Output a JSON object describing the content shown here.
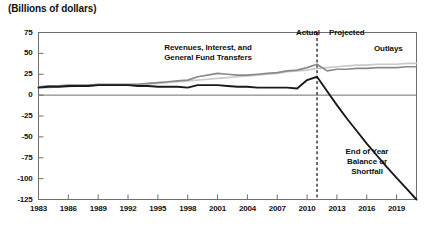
{
  "header": {
    "unit_title": "(Billions of dollars)"
  },
  "annotations": {
    "actual_label": "Actual",
    "projected_label": "Projected",
    "outlays_label": "Outlays",
    "revenues_label_line1": "Revenues, Interest, and",
    "revenues_label_line2": "General Fund Transfers",
    "balance_label_line1": "End of Year",
    "balance_label_line2": "Balance or",
    "balance_label_line3": "Shortfall"
  },
  "colors": {
    "outlays": "#c9c9c9",
    "revenues": "#8a8a8a",
    "balance": "#1a1a1a",
    "axis": "#6f6f6f",
    "divider": "#111111",
    "text": "#111111"
  },
  "chart_data": {
    "type": "line",
    "title": "(Billions of dollars)",
    "xlabel": "",
    "ylabel": "Billions of dollars",
    "xlim": [
      1983,
      2021
    ],
    "ylim": [
      -125,
      75
    ],
    "ytick_labels": [
      "75",
      "50",
      "25",
      "0",
      "-25",
      "-50",
      "-75",
      "-100",
      "-125"
    ],
    "yticks": [
      75,
      50,
      25,
      0,
      -25,
      -50,
      -75,
      -100,
      -125
    ],
    "xtick_labels": [
      "1983",
      "1986",
      "1989",
      "1992",
      "1995",
      "1998",
      "2001",
      "2004",
      "2007",
      "2010",
      "2013",
      "2016",
      "2019"
    ],
    "xticks": [
      1983,
      1986,
      1989,
      1992,
      1995,
      1998,
      2001,
      2004,
      2007,
      2010,
      2013,
      2016,
      2019
    ],
    "grid": false,
    "legend_position": "inline-annotations",
    "divider_year": 2011,
    "divider_style": "dashed",
    "x": [
      1983,
      1984,
      1985,
      1986,
      1987,
      1988,
      1989,
      1990,
      1991,
      1992,
      1993,
      1994,
      1995,
      1996,
      1997,
      1998,
      1999,
      2000,
      2001,
      2002,
      2003,
      2004,
      2005,
      2006,
      2007,
      2008,
      2009,
      2010,
      2011,
      2012,
      2013,
      2014,
      2015,
      2016,
      2017,
      2018,
      2019,
      2020,
      2021
    ],
    "series": [
      {
        "name": "Revenues, Interest, and General Fund Transfers",
        "color": "#8a8a8a",
        "values": [
          10,
          11,
          11,
          12,
          12,
          12,
          13,
          13,
          13,
          13,
          13,
          14,
          15,
          16,
          17,
          18,
          22,
          24,
          26,
          25,
          24,
          24,
          25,
          26,
          27,
          29,
          30,
          33,
          37,
          29,
          31,
          31,
          32,
          32,
          33,
          33,
          33,
          34,
          34
        ]
      },
      {
        "name": "Outlays",
        "color": "#c9c9c9",
        "values": [
          9,
          9,
          10,
          10,
          11,
          11,
          12,
          12,
          12,
          12,
          13,
          13,
          14,
          15,
          16,
          17,
          18,
          19,
          20,
          21,
          22,
          23,
          24,
          25,
          26,
          28,
          29,
          30,
          32,
          33,
          34,
          35,
          36,
          36,
          37,
          37,
          37,
          38,
          38
        ]
      },
      {
        "name": "End of Year Balance or Shortfall",
        "color": "#1a1a1a",
        "values": [
          9,
          10,
          10,
          11,
          11,
          11,
          12,
          12,
          12,
          12,
          11,
          11,
          10,
          10,
          10,
          9,
          12,
          12,
          12,
          11,
          10,
          10,
          9,
          9,
          9,
          9,
          8,
          18,
          22,
          5,
          -12,
          -28,
          -43,
          -58,
          -72,
          -86,
          -99,
          -112,
          -125
        ]
      }
    ]
  }
}
